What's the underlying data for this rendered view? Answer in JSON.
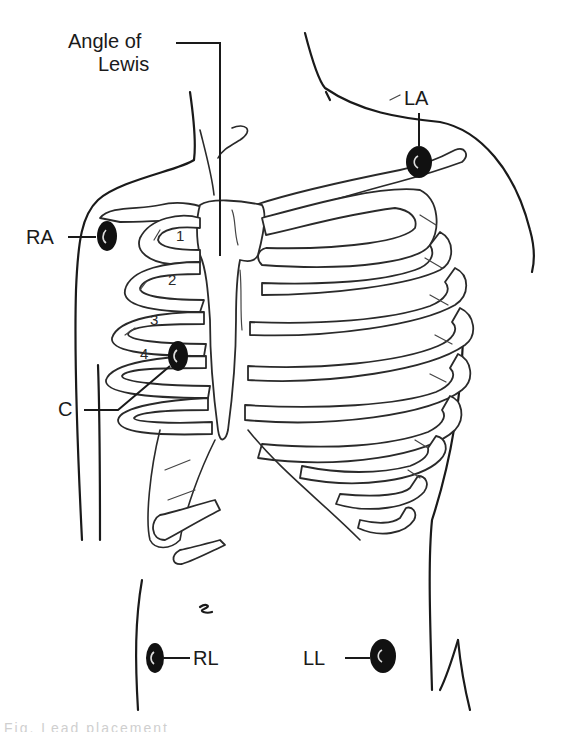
{
  "figure": {
    "colors": {
      "ink": "#1a1a1a",
      "electrode": "#111111",
      "background": "#ffffff"
    }
  },
  "labels": {
    "angle_of_lewis_line1": "Angle of",
    "angle_of_lewis_line2": "Lewis",
    "ra": "RA",
    "la": "LA",
    "c": "C",
    "rl": "RL",
    "ll": "LL"
  },
  "rib_numbers": [
    "1",
    "2",
    "3",
    "4"
  ],
  "electrodes": [
    {
      "id": "RA",
      "name": "Right arm",
      "cx": 107,
      "cy": 236
    },
    {
      "id": "LA",
      "name": "Left arm",
      "cx": 419,
      "cy": 160
    },
    {
      "id": "C",
      "name": "Chest",
      "cx": 178,
      "cy": 356
    },
    {
      "id": "RL",
      "name": "Right leg",
      "cx": 155,
      "cy": 658
    },
    {
      "id": "LL",
      "name": "Left leg",
      "cx": 383,
      "cy": 658
    }
  ],
  "caption": "Fig. Lead placement"
}
